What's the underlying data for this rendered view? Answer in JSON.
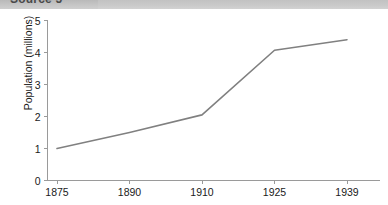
{
  "banner": {
    "title": "Source 5"
  },
  "chart_data": {
    "type": "line",
    "title": "",
    "subtitle": "",
    "xlabel": "",
    "ylabel": "Population (millions)",
    "categories": [
      "1875",
      "1890",
      "1910",
      "1925",
      "1939"
    ],
    "x_tick_labels": [
      "1875",
      "1890",
      "1910",
      "1925",
      "1939"
    ],
    "y_tick_labels": [
      "0",
      "1",
      "2",
      "3",
      "4",
      "5"
    ],
    "ylim": [
      0,
      5
    ],
    "y_ticks": [
      0,
      1,
      2,
      3,
      4,
      5
    ],
    "grid": false,
    "legend": false,
    "legend_position": "none",
    "series": [
      {
        "name": "Population",
        "color": "#808080",
        "values": [
          1.0,
          1.5,
          2.05,
          4.07,
          4.4
        ]
      }
    ],
    "annotations": []
  },
  "style": {
    "line_color": "#808080",
    "axis_color": "#9a9a9a",
    "text_color": "#1a1a1a",
    "banner_color": "#c6c6c6",
    "background": "#ffffff"
  }
}
